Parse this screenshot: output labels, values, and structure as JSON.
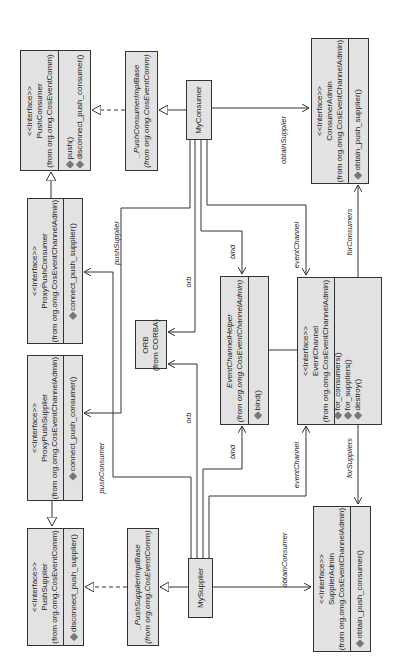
{
  "diagram": {
    "type": "UML class diagram (rotated 90° counter-clockwise)",
    "classes": {
      "push_consumer": {
        "stereotype": "<<Interface>>",
        "name": "PushConsumer",
        "package": "(from org.omg.CosEventComm)",
        "operations": [
          "push()",
          "disconnect_push_consumer()"
        ]
      },
      "proxy_push_consumer": {
        "stereotype": "<<Interface>>",
        "name": "ProxyPushConsumer",
        "package": "(from org.omg.CosEventChannelAdmin)",
        "operations": [
          "connect_push_supplier()"
        ]
      },
      "proxy_push_supplier": {
        "stereotype": "<<Interface>>",
        "name": "ProxyPushSupplier",
        "package": "(from org.omg.CosEventChannelAdmin)",
        "operations": [
          "connect_push_consumer()"
        ]
      },
      "push_supplier": {
        "stereotype": "<<Interface>>",
        "name": "PushSupplier",
        "package": "(from org.omg.CosEventComm)",
        "operations": [
          "disconnect_push_supplier()"
        ]
      },
      "push_consumer_impl_base": {
        "name": "_PushConsumerImplBase",
        "package": "(from org.omg.CosEventComm)"
      },
      "push_supplier_impl_base": {
        "name": "_PushSupplierImplBase",
        "package": "(from org.omg.CosEventComm)"
      },
      "orb": {
        "name": "ORB",
        "package": "(from CORBA)"
      },
      "my_consumer": {
        "name": "MyConsumer"
      },
      "my_supplier": {
        "name": "MySupplier"
      },
      "event_channel_helper": {
        "name": "EventChannelHelper",
        "package": "(from org.omg.CosEventChannelAdmin)",
        "operations": [
          "bind()"
        ]
      },
      "event_channel": {
        "stereotype": "<<Interface>>",
        "name": "EventChannel",
        "package": "(from org.omg.CosEventChannelAdmin)",
        "operations": [
          "for_consumers()",
          "for_suppliers()",
          "destroy()"
        ]
      },
      "consumer_admin": {
        "stereotype": "<<Interface>>",
        "name": "ConsumerAdmin",
        "package": "(from org.omg.CosEventChannelAdmin)",
        "operations": [
          "obtain_push_supplier()"
        ]
      },
      "supplier_admin": {
        "stereotype": "<<Interface>>",
        "name": "SupplierAdmin",
        "package": "(from org.omg.CosEventChannelAdmin)",
        "operations": [
          "obtain_push_consumer()"
        ]
      }
    },
    "associations": {
      "push_supplier": "pushSupplier",
      "push_consumer": "pushConsumer",
      "orb_consumer": "orb",
      "orb_supplier": "orb",
      "bind_consumer": "bind",
      "bind_supplier": "bind",
      "event_channel_consumer": "eventChannel",
      "event_channel_supplier": "eventChannel",
      "for_consumers": "forConsumers",
      "for_suppliers": "forSuppliers",
      "obtain_supplier": "obtainSupplier",
      "obtain_consumer": "obtainConsumer"
    },
    "colors": {
      "box_fill": "#e2e2e2",
      "line": "#333333",
      "background": "#ffffff"
    }
  }
}
